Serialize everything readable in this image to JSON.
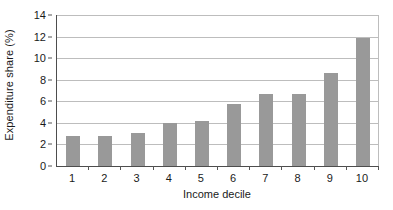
{
  "chart_data": {
    "type": "bar",
    "title": "",
    "subtitle": "",
    "xlabel": "Income decile",
    "ylabel": "Expenditure share (%)",
    "categories": [
      "1",
      "2",
      "3",
      "4",
      "5",
      "6",
      "7",
      "8",
      "9",
      "10"
    ],
    "values": [
      2.8,
      2.75,
      3.1,
      3.95,
      4.2,
      5.75,
      6.65,
      6.65,
      8.6,
      11.85
    ],
    "ylim": [
      0,
      14
    ],
    "ytick_labels": [
      "0",
      "2",
      "4",
      "6",
      "8",
      "10",
      "12",
      "14"
    ],
    "ytick_values": [
      0,
      2,
      4,
      6,
      8,
      10,
      12,
      14
    ],
    "ytick_step": 2,
    "grid": "horizontal",
    "legend": "none",
    "annotations": [],
    "series": [
      {
        "name": "Expenditure share",
        "values": [
          2.8,
          2.75,
          3.1,
          3.95,
          4.2,
          5.75,
          6.65,
          6.65,
          8.6,
          11.85
        ],
        "color": "#999999"
      }
    ]
  },
  "colors": {
    "bar_fill": "#999999",
    "gridline": "#bdbdbd",
    "axis_line": "#4d4d4d",
    "text": "#1a1a1a",
    "background": "#ffffff"
  }
}
